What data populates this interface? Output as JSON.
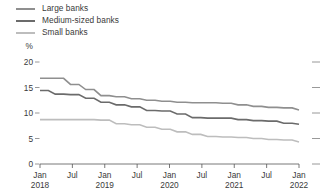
{
  "legend": {
    "items": [
      {
        "label": "Large banks",
        "color": "#8f8f8f",
        "key": "large"
      },
      {
        "label": "Medium-sized banks",
        "color": "#6b6b6b",
        "key": "medium"
      },
      {
        "label": "Small banks",
        "color": "#bdbdbd",
        "key": "small"
      }
    ]
  },
  "axes": {
    "unit": "%",
    "y_ticks": [
      "20",
      "15",
      "10",
      "5",
      "0"
    ],
    "x_ticks": [
      {
        "month": "Jan",
        "year": "2018"
      },
      {
        "month": "Jul",
        "year": ""
      },
      {
        "month": "Jan",
        "year": "2019"
      },
      {
        "month": "Jul",
        "year": ""
      },
      {
        "month": "Jan",
        "year": "2020"
      },
      {
        "month": "Jul",
        "year": ""
      },
      {
        "month": "Jan",
        "year": "2021"
      },
      {
        "month": "Jul",
        "year": ""
      },
      {
        "month": "Jan",
        "year": "2022"
      }
    ]
  },
  "chart_data": {
    "type": "line",
    "title": "",
    "xlabel": "",
    "ylabel": "%",
    "ylim": [
      0,
      20
    ],
    "yticks": [
      0,
      5,
      10,
      15,
      20
    ],
    "grid": false,
    "legend_position": "top-left",
    "x": [
      "Jan 2018",
      "Apr 2018",
      "Jul 2018",
      "Oct 2018",
      "Jan 2019",
      "Apr 2019",
      "Jul 2019",
      "Oct 2019",
      "Jan 2020",
      "Apr 2020",
      "Jul 2020",
      "Oct 2020",
      "Jan 2021",
      "Apr 2021",
      "Jul 2021",
      "Oct 2021",
      "Jan 2022",
      "Apr 2022"
    ],
    "series": [
      {
        "name": "Large banks",
        "color": "#8f8f8f",
        "values": [
          16.8,
          16.8,
          15.6,
          14.6,
          13.4,
          13.2,
          12.8,
          12.5,
          12.3,
          12.1,
          12.0,
          12.0,
          11.9,
          11.6,
          11.3,
          11.1,
          11.0,
          10.6
        ]
      },
      {
        "name": "Medium-sized banks",
        "color": "#6b6b6b",
        "values": [
          14.4,
          13.7,
          13.6,
          12.9,
          12.1,
          11.6,
          11.2,
          10.5,
          10.4,
          9.8,
          9.1,
          9.0,
          9.0,
          8.7,
          8.5,
          8.4,
          8.0,
          7.8
        ]
      },
      {
        "name": "Small banks",
        "color": "#bdbdbd",
        "values": [
          8.7,
          8.7,
          8.7,
          8.7,
          8.6,
          7.9,
          7.7,
          7.2,
          6.8,
          6.3,
          5.8,
          5.4,
          5.3,
          5.2,
          5.0,
          4.8,
          4.7,
          4.3
        ]
      }
    ]
  }
}
